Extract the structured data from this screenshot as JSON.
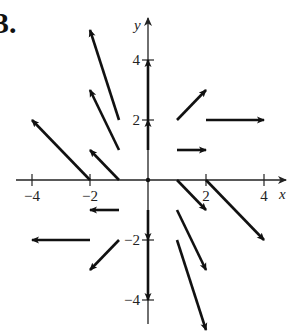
{
  "figure": {
    "number_label": "3.",
    "x_axis_label": "x",
    "y_axis_label": "y",
    "x_ticks": [
      {
        "value": -4,
        "label": "−4"
      },
      {
        "value": -2,
        "label": "−2"
      },
      {
        "value": 2,
        "label": "2"
      },
      {
        "value": 4,
        "label": "4"
      }
    ],
    "y_ticks": [
      {
        "value": 4,
        "label": "4"
      },
      {
        "value": 2,
        "label": "2"
      },
      {
        "value": -2,
        "label": "−2"
      },
      {
        "value": -4,
        "label": "−4"
      }
    ],
    "colors": {
      "ink": "#111111",
      "background": "#ffffff"
    }
  },
  "chart_data": {
    "type": "vector_field",
    "title": "3.",
    "xlabel": "x",
    "ylabel": "y",
    "xlim": [
      -4.5,
      4.7
    ],
    "ylim": [
      -5,
      5
    ],
    "field": "F(x, y) = <x, y - x>",
    "vectors": [
      {
        "x": -1,
        "y": 2,
        "dx": -1,
        "dy": 3
      },
      {
        "x": -1,
        "y": 1,
        "dx": -1,
        "dy": 2
      },
      {
        "x": -1,
        "y": 0,
        "dx": -1,
        "dy": 1
      },
      {
        "x": -2,
        "y": 0,
        "dx": -2,
        "dy": 2
      },
      {
        "x": -1,
        "y": -1,
        "dx": -1,
        "dy": 0
      },
      {
        "x": -2,
        "y": -2,
        "dx": -2,
        "dy": 0
      },
      {
        "x": -1,
        "y": -2,
        "dx": -1,
        "dy": -1
      },
      {
        "x": 0,
        "y": 1,
        "dx": 0,
        "dy": 1
      },
      {
        "x": 0,
        "y": 2,
        "dx": 0,
        "dy": 2
      },
      {
        "x": 0,
        "y": -1,
        "dx": 0,
        "dy": -1
      },
      {
        "x": 0,
        "y": -2,
        "dx": 0,
        "dy": -2
      },
      {
        "x": 1,
        "y": 2,
        "dx": 1,
        "dy": 1
      },
      {
        "x": 2,
        "y": 2,
        "dx": 2,
        "dy": 0
      },
      {
        "x": 1,
        "y": 1,
        "dx": 1,
        "dy": 0
      },
      {
        "x": 1,
        "y": 0,
        "dx": 1,
        "dy": -1
      },
      {
        "x": 2,
        "y": 0,
        "dx": 2,
        "dy": -2
      },
      {
        "x": 1,
        "y": -1,
        "dx": 1,
        "dy": -2
      },
      {
        "x": 1,
        "y": -2,
        "dx": 1,
        "dy": -3
      }
    ],
    "grid": false
  }
}
